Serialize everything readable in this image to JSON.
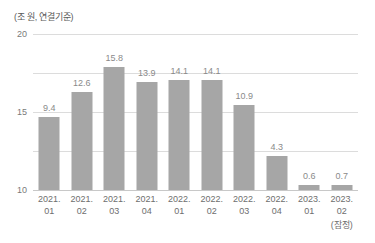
{
  "chart_data": {
    "type": "bar",
    "title": "",
    "subtitle": "",
    "unit_label": "(조 원, 연결기준)",
    "xlabel": "",
    "ylabel": "",
    "ylim": [
      0,
      20
    ],
    "yticks": [
      "0",
      "5",
      "10",
      "15",
      "20"
    ],
    "grid": true,
    "legend": false,
    "bar_color": "#a6a6a6",
    "value_label_color": "#8a8a8a",
    "gridline_color": "#dcdcdc",
    "axis_text_color": "#6e6e6e",
    "categories": [
      {
        "year": "2021.",
        "quarter": "01",
        "note": ""
      },
      {
        "year": "2021.",
        "quarter": "02",
        "note": ""
      },
      {
        "year": "2021.",
        "quarter": "03",
        "note": ""
      },
      {
        "year": "2021.",
        "quarter": "04",
        "note": ""
      },
      {
        "year": "2022.",
        "quarter": "01",
        "note": ""
      },
      {
        "year": "2022.",
        "quarter": "02",
        "note": ""
      },
      {
        "year": "2022.",
        "quarter": "03",
        "note": ""
      },
      {
        "year": "2022.",
        "quarter": "04",
        "note": ""
      },
      {
        "year": "2023.",
        "quarter": "01",
        "note": ""
      },
      {
        "year": "2023.",
        "quarter": "02",
        "note": "(잠정)"
      }
    ],
    "values": [
      9.4,
      12.6,
      15.8,
      13.9,
      14.1,
      14.1,
      10.9,
      4.3,
      0.6,
      0.7
    ],
    "value_labels": [
      "9.4",
      "12.6",
      "15.8",
      "13.9",
      "14.1",
      "14.1",
      "10.9",
      "4.3",
      "0.6",
      "0.7"
    ]
  }
}
